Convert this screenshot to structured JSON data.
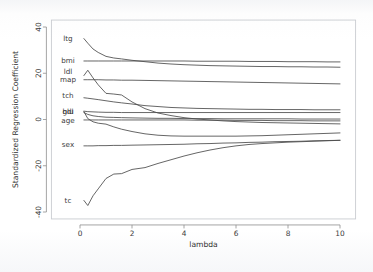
{
  "chart_data": {
    "type": "line",
    "title": "",
    "xlabel": "lambda",
    "ylabel": "Standardized Regression Coefficient",
    "xlim": [
      -1.1,
      10.6
    ],
    "ylim": [
      -43,
      43
    ],
    "xticks": [
      0,
      2,
      4,
      6,
      8,
      10
    ],
    "xticklabels": [
      "0",
      "2",
      "4",
      "6",
      "8",
      "10"
    ],
    "yticks": [
      40,
      20,
      0,
      -20,
      -40
    ],
    "yticklabels": [
      "40",
      "20",
      "0",
      "-20",
      "-40"
    ],
    "grid": false,
    "legend": "inline-left-labels",
    "line_color": "#4a4a4a",
    "x": [
      0.15,
      0.3,
      0.5,
      0.7,
      1.0,
      1.3,
      1.6,
      2.0,
      2.5,
      3.0,
      3.5,
      4.0,
      4.5,
      5.0,
      5.5,
      6.0,
      6.5,
      7.0,
      7.5,
      8.0,
      8.5,
      9.0,
      9.5,
      10.0
    ],
    "series": [
      {
        "name": "ltg",
        "label": "ltg",
        "label_y": 35.0,
        "values": [
          35.0,
          33.0,
          30.5,
          29.0,
          27.3,
          26.6,
          26.2,
          25.6,
          25.0,
          24.4,
          24.0,
          23.7,
          23.5,
          23.3,
          23.2,
          23.1,
          23.0,
          22.9,
          22.9,
          22.8,
          22.8,
          22.7,
          22.7,
          22.6
        ]
      },
      {
        "name": "bmi",
        "label": "bmi",
        "label_y": 25.2,
        "values": [
          25.3,
          25.3,
          25.3,
          25.3,
          25.3,
          25.3,
          25.3,
          25.3,
          25.3,
          25.3,
          25.3,
          25.3,
          25.2,
          25.2,
          25.2,
          25.2,
          25.1,
          25.1,
          25.1,
          25.0,
          25.0,
          25.0,
          24.9,
          24.9
        ]
      },
      {
        "name": "ldl",
        "label": "ldl",
        "label_y": 20.5,
        "values": [
          19.0,
          21.3,
          18.0,
          15.0,
          11.3,
          11.0,
          10.6,
          7.6,
          4.7,
          2.8,
          1.7,
          0.8,
          0.2,
          -0.2,
          -0.6,
          -0.9,
          -1.1,
          -1.3,
          -1.4,
          -1.5,
          -1.6,
          -1.7,
          -1.8,
          -1.9
        ]
      },
      {
        "name": "map",
        "label": "map",
        "label_y": 16.9,
        "values": [
          17.2,
          17.2,
          17.2,
          17.2,
          17.1,
          17.1,
          17.0,
          17.0,
          16.9,
          16.8,
          16.7,
          16.6,
          16.5,
          16.4,
          16.3,
          16.2,
          16.1,
          16.0,
          15.9,
          15.8,
          15.7,
          15.6,
          15.5,
          15.4
        ]
      },
      {
        "name": "tch",
        "label": "tch",
        "label_y": 10.3,
        "values": [
          9.4,
          9.2,
          8.9,
          8.6,
          8.1,
          7.6,
          7.2,
          6.7,
          6.0,
          5.6,
          5.2,
          5.0,
          4.8,
          4.7,
          4.6,
          4.5,
          4.4,
          4.4,
          4.3,
          4.3,
          4.3,
          4.2,
          4.2,
          4.2
        ]
      },
      {
        "name": "hdl",
        "label": "hdl",
        "label_y": 3.3,
        "values": [
          3.6,
          3.4,
          3.3,
          3.2,
          3.1,
          3.1,
          3.0,
          3.0,
          3.0,
          3.0,
          3.0,
          3.0,
          3.0,
          3.0,
          3.0,
          3.0,
          3.0,
          3.0,
          3.0,
          3.0,
          3.0,
          3.0,
          3.0,
          3.0
        ]
      },
      {
        "name": "glu",
        "label": "glu",
        "label_y": 3.3,
        "values": [
          3.0,
          2.2,
          1.6,
          1.3,
          1.0,
          0.9,
          0.8,
          0.7,
          0.6,
          0.5,
          0.5,
          0.4,
          0.4,
          0.4,
          0.3,
          0.3,
          0.3,
          0.3,
          0.3,
          0.3,
          0.2,
          0.2,
          0.2,
          0.2
        ]
      },
      {
        "name": "age",
        "label": "age",
        "label_y": -0.8,
        "values": [
          -0.2,
          -0.2,
          -0.2,
          -0.2,
          -0.2,
          -0.2,
          -0.2,
          -0.2,
          -0.2,
          -0.2,
          -0.2,
          -0.2,
          -0.3,
          -0.3,
          -0.3,
          -0.4,
          -0.4,
          -0.4,
          -0.5,
          -0.5,
          -0.5,
          -0.6,
          -0.6,
          -0.6
        ]
      },
      {
        "name": "tch2",
        "label": "",
        "label_y": null,
        "values": [
          3.4,
          0.4,
          -1.0,
          -1.6,
          -2.0,
          -3.2,
          -4.2,
          -5.2,
          -6.2,
          -6.8,
          -7.1,
          -7.2,
          -7.2,
          -7.2,
          -7.2,
          -7.2,
          -7.1,
          -7.0,
          -6.8,
          -6.6,
          -6.4,
          -6.2,
          -6.0,
          -5.8
        ]
      },
      {
        "name": "sex",
        "label": "sex",
        "label_y": -11.2,
        "values": [
          -11.4,
          -11.4,
          -11.4,
          -11.3,
          -11.3,
          -11.2,
          -11.2,
          -11.1,
          -11.0,
          -10.9,
          -10.8,
          -10.7,
          -10.5,
          -10.4,
          -10.2,
          -10.1,
          -9.9,
          -9.8,
          -9.6,
          -9.5,
          -9.4,
          -9.2,
          -9.1,
          -9.0
        ]
      },
      {
        "name": "tc",
        "label": "tc",
        "label_y": -35.2,
        "values": [
          -35.0,
          -37.2,
          -33.0,
          -30.0,
          -25.5,
          -23.6,
          -23.4,
          -21.6,
          -20.8,
          -19.0,
          -17.4,
          -15.8,
          -14.4,
          -13.2,
          -12.2,
          -11.4,
          -10.8,
          -10.4,
          -10.1,
          -9.8,
          -9.6,
          -9.4,
          -9.2,
          -9.0
        ]
      }
    ],
    "series_labels": [
      "ltg",
      "bmi",
      "ldl",
      "map",
      "tch",
      "hdl",
      "glu",
      "age",
      "sex",
      "tc"
    ]
  }
}
